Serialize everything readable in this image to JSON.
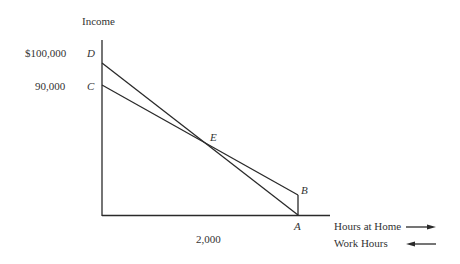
{
  "diagram": {
    "y_axis_label": "Income",
    "y_ticks": [
      {
        "value_label": "$100,000",
        "point": "D"
      },
      {
        "value_label": "90,000",
        "point": "C"
      }
    ],
    "x_tick": "2,000",
    "points": {
      "A": "A",
      "B": "B",
      "C": "C",
      "D": "D",
      "E": "E"
    },
    "legend": [
      {
        "label": "Hours at Home",
        "direction": "right"
      },
      {
        "label": "Work Hours",
        "direction": "left"
      }
    ],
    "line_color": "#2a2a2a"
  }
}
